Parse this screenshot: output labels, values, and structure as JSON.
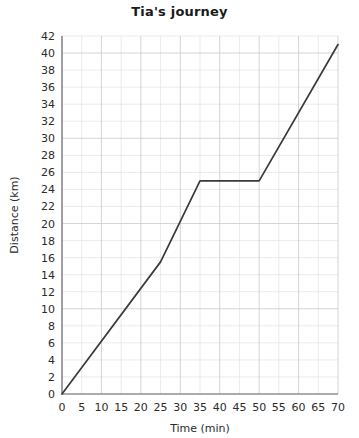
{
  "chart_data": {
    "type": "line",
    "title": "Tia's journey",
    "xlabel": "Time (min)",
    "ylabel": "Distance (km)",
    "xlim": [
      0,
      70
    ],
    "ylim": [
      0,
      42
    ],
    "grid": true,
    "legend": "none",
    "x_ticks": [
      0,
      5,
      10,
      15,
      20,
      25,
      30,
      35,
      40,
      45,
      50,
      55,
      60,
      65,
      70
    ],
    "y_ticks": [
      0,
      2,
      4,
      6,
      8,
      10,
      12,
      14,
      16,
      18,
      20,
      22,
      24,
      26,
      28,
      30,
      32,
      34,
      36,
      38,
      40,
      42
    ],
    "x_tick_labels": [
      "0",
      "5",
      "10",
      "15",
      "20",
      "25",
      "30",
      "35",
      "40",
      "45",
      "50",
      "55",
      "60",
      "65",
      "70"
    ],
    "y_tick_labels": [
      "0",
      "2",
      "4",
      "6",
      "8",
      "10",
      "12",
      "14",
      "16",
      "18",
      "20",
      "22",
      "24",
      "26",
      "28",
      "30",
      "32",
      "34",
      "36",
      "38",
      "40",
      "42"
    ],
    "series": [
      {
        "name": "Tia's journey",
        "color": "#3a3a3a",
        "points": [
          {
            "x": 0,
            "y": 0
          },
          {
            "x": 25,
            "y": 15.5
          },
          {
            "x": 35,
            "y": 25
          },
          {
            "x": 50,
            "y": 25
          },
          {
            "x": 70,
            "y": 41
          }
        ]
      }
    ]
  }
}
